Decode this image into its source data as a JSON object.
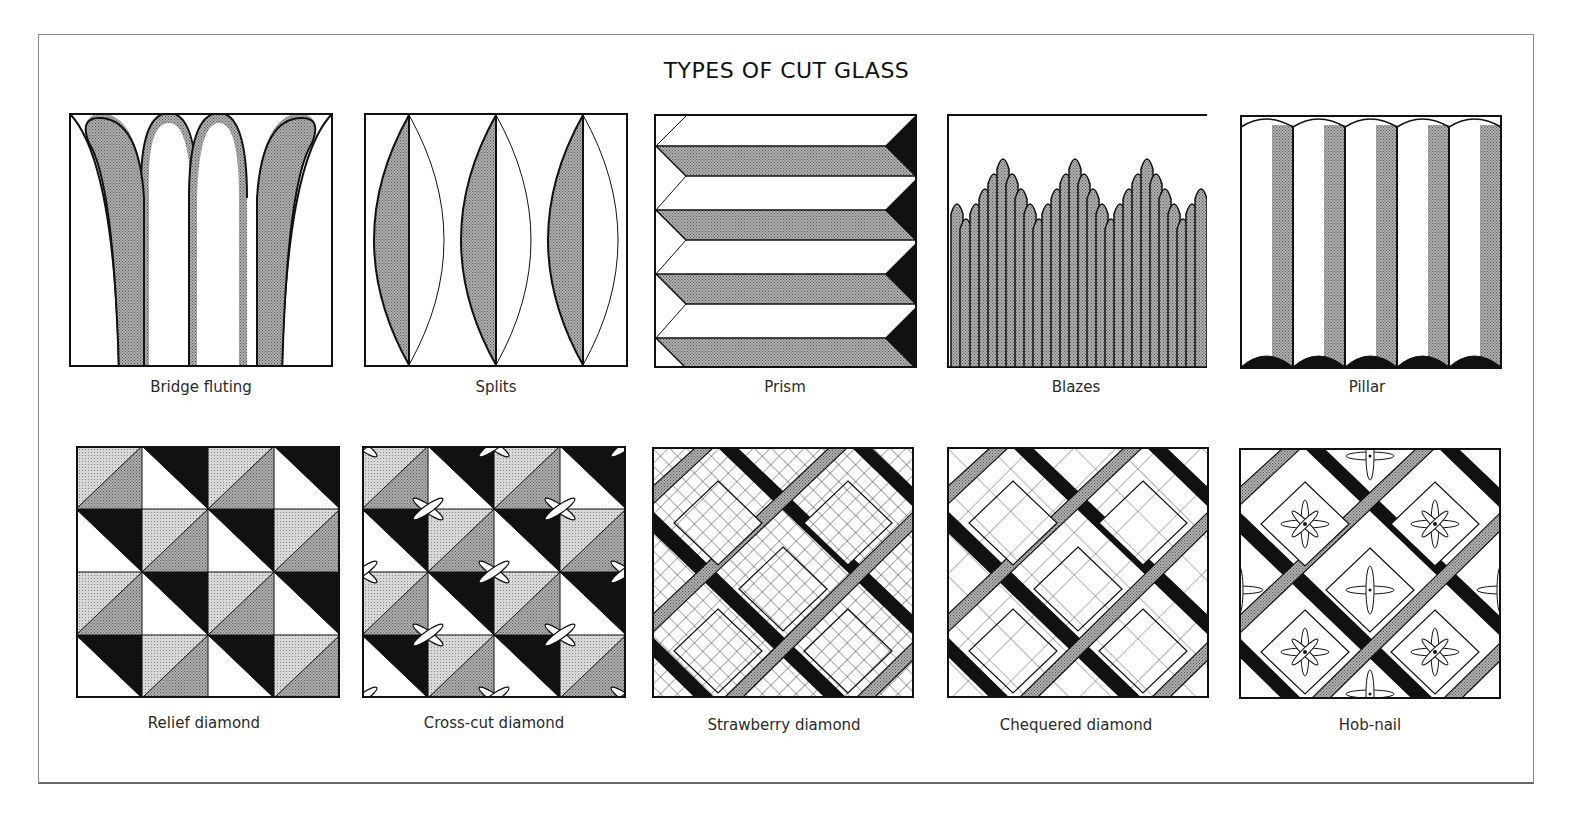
{
  "title": "TYPES OF CUT GLASS",
  "colors": {
    "ink": "#111111",
    "shade_dark": "#9a9a9a",
    "shade_light": "#c8c8c8",
    "paper": "#ffffff",
    "frame": "#8a8a8a"
  },
  "rows": [
    {
      "panels": [
        {
          "id": "bridge-fluting",
          "caption": "Bridge fluting"
        },
        {
          "id": "splits",
          "caption": "Splits"
        },
        {
          "id": "prism",
          "caption": "Prism"
        },
        {
          "id": "blazes",
          "caption": "Blazes"
        },
        {
          "id": "pillar",
          "caption": "Pillar"
        }
      ]
    },
    {
      "panels": [
        {
          "id": "relief-diamond",
          "caption": "Relief diamond"
        },
        {
          "id": "cross-cut-diamond",
          "caption": "Cross-cut diamond"
        },
        {
          "id": "strawberry-diamond",
          "caption": "Strawberry diamond"
        },
        {
          "id": "chequered-diamond",
          "caption": "Chequered diamond"
        },
        {
          "id": "hob-nail",
          "caption": "Hob-nail"
        }
      ]
    }
  ]
}
